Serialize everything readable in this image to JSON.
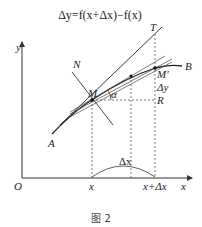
{
  "figure": {
    "formula": "Δy=f(x+Δx)−f(x)",
    "caption": "图 2",
    "axes": {
      "origin_label": "O",
      "x_axis_label": "x",
      "y_axis_label": "y"
    },
    "points": {
      "M": "M",
      "M_prime": "M'",
      "R": "R",
      "T": "T",
      "N": "N",
      "A": "A",
      "B": "B"
    },
    "annotations": {
      "alpha": "α",
      "delta_y": "Δy",
      "delta_x": "Δx",
      "x_tick": "x",
      "x_plus_dx_tick": "x+Δx"
    }
  }
}
